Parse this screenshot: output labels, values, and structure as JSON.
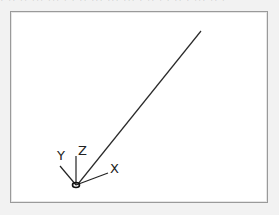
{
  "top_strip": {
    "text": "· ·· ·· ··· ··· · · ·· ··· ··· ···  · ·· · · ·· · ··· ·· ·"
  },
  "viewport": {
    "background": "#ffffff",
    "border_color": "#9a9a9a",
    "line_color": "#222222",
    "gizmo": {
      "origin": {
        "x": 76,
        "y": 185
      },
      "axes": [
        {
          "name": "X",
          "label": "X",
          "end": {
            "x": 108,
            "y": 173
          },
          "label_pos": {
            "x": 110,
            "y": 173
          }
        },
        {
          "name": "Y",
          "label": "Y",
          "end": {
            "x": 60,
            "y": 166
          },
          "label_pos": {
            "x": 57,
            "y": 160
          }
        },
        {
          "name": "Z",
          "label": "Z",
          "end": {
            "x": 76,
            "y": 156
          },
          "label_pos": {
            "x": 78,
            "y": 155
          }
        }
      ]
    },
    "segment": {
      "start": {
        "x": 78,
        "y": 184
      },
      "end": {
        "x": 201,
        "y": 31
      }
    }
  }
}
